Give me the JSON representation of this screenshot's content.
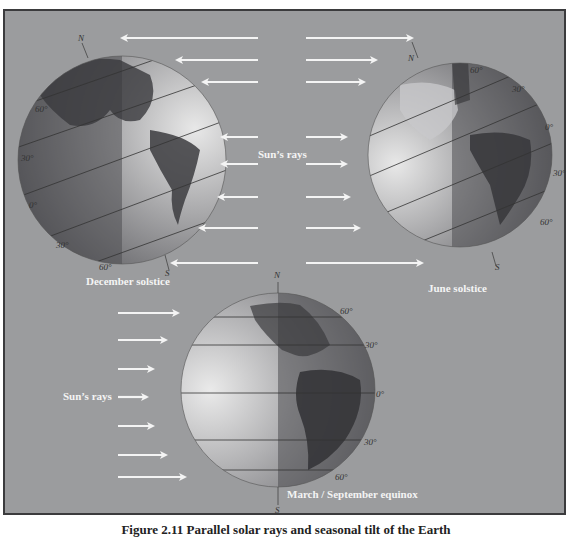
{
  "figure": {
    "caption": "Figure 2.11 Parallel solar rays and seasonal tilt of the Earth",
    "background_color": "#9b9c9e",
    "border_color": "#3b3b3d",
    "label_color": "#f4f4f4"
  },
  "panels": {
    "december": {
      "title": "December solstice",
      "north": "N",
      "south": "S",
      "lat_labels": [
        "60°",
        "30°",
        "0°",
        "30°",
        "60°"
      ]
    },
    "june": {
      "title": "June solstice",
      "north": "N",
      "south": "S",
      "lat_labels": [
        "60°",
        "30°",
        "0°",
        "30°",
        "60°"
      ]
    },
    "equinox": {
      "title": "March / September equinox",
      "north": "N",
      "south": "S",
      "lat_labels": [
        "60°",
        "30°",
        "0°",
        "30°",
        "60°"
      ]
    }
  },
  "sun_rays_top": {
    "label": "Sun’s rays",
    "left_arrow_count": 8,
    "right_arrow_count": 8
  },
  "sun_rays_bottom": {
    "label": "Sun’s rays",
    "arrow_count": 7
  },
  "icons": {
    "arrow_left": "arrow-left-icon",
    "arrow_right": "arrow-right-icon",
    "globe": "globe-icon"
  }
}
